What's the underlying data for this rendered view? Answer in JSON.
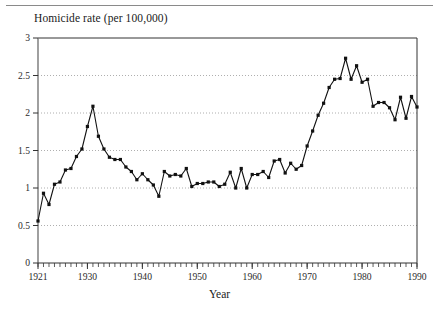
{
  "figure": {
    "title": "Homicide rate (per 100,000)",
    "x_axis_label": "Year",
    "has_top_rule": true
  },
  "chart_data": {
    "type": "line",
    "title": "Homicide rate (per 100,000)",
    "subtitle": "",
    "xlabel": "Year",
    "ylabel": "Homicide rate (per 100,000)",
    "xlim": [
      1921,
      1990
    ],
    "ylim": [
      0,
      3
    ],
    "grid": true,
    "grid_axis": "y",
    "grid_style": "dotted",
    "legend": null,
    "legend_position": "none",
    "marker": "square",
    "line_color": "#111111",
    "marker_color": "#111111",
    "x_ticks_labeled": [
      1921,
      1930,
      1940,
      1950,
      1960,
      1970,
      1980,
      1990
    ],
    "x_tick_interval_minor": 1,
    "y_ticks": [
      0,
      0.5,
      1,
      1.5,
      2,
      2.5,
      3
    ],
    "y_tick_labels": [
      "0",
      "0.5",
      "1",
      "1.5",
      "2",
      "2.5",
      "3"
    ],
    "x": [
      1921,
      1922,
      1923,
      1924,
      1925,
      1926,
      1927,
      1928,
      1929,
      1930,
      1931,
      1932,
      1933,
      1934,
      1935,
      1936,
      1937,
      1938,
      1939,
      1940,
      1941,
      1942,
      1943,
      1944,
      1945,
      1946,
      1947,
      1948,
      1949,
      1950,
      1951,
      1952,
      1953,
      1954,
      1955,
      1956,
      1957,
      1958,
      1959,
      1960,
      1961,
      1962,
      1963,
      1964,
      1965,
      1966,
      1967,
      1968,
      1969,
      1970,
      1971,
      1972,
      1973,
      1974,
      1975,
      1976,
      1977,
      1978,
      1979,
      1980,
      1981,
      1982,
      1983,
      1984,
      1985,
      1986,
      1987,
      1988,
      1989,
      1990
    ],
    "values": [
      0.56,
      0.93,
      0.78,
      1.05,
      1.08,
      1.24,
      1.26,
      1.42,
      1.52,
      1.82,
      2.09,
      1.69,
      1.52,
      1.41,
      1.38,
      1.38,
      1.28,
      1.22,
      1.11,
      1.19,
      1.11,
      1.04,
      0.89,
      1.22,
      1.16,
      1.18,
      1.16,
      1.26,
      1.02,
      1.06,
      1.06,
      1.08,
      1.08,
      1.02,
      1.05,
      1.21,
      1.0,
      1.26,
      1.0,
      1.18,
      1.18,
      1.22,
      1.14,
      1.36,
      1.38,
      1.2,
      1.33,
      1.25,
      1.3,
      1.56,
      1.76,
      1.97,
      2.13,
      2.34,
      2.45,
      2.46,
      2.73,
      2.45,
      2.63,
      2.41,
      2.45,
      2.09,
      2.14,
      2.14,
      2.07,
      1.91,
      2.21,
      1.93,
      2.22,
      2.08
    ],
    "series": [
      {
        "name": "Homicide rate",
        "values": [
          0.56,
          0.93,
          0.78,
          1.05,
          1.08,
          1.24,
          1.26,
          1.42,
          1.52,
          1.82,
          2.09,
          1.69,
          1.52,
          1.41,
          1.38,
          1.38,
          1.28,
          1.22,
          1.11,
          1.19,
          1.11,
          1.04,
          0.89,
          1.22,
          1.16,
          1.18,
          1.16,
          1.26,
          1.02,
          1.06,
          1.06,
          1.08,
          1.08,
          1.02,
          1.05,
          1.21,
          1.0,
          1.26,
          1.0,
          1.18,
          1.18,
          1.22,
          1.14,
          1.36,
          1.38,
          1.2,
          1.33,
          1.25,
          1.3,
          1.56,
          1.76,
          1.97,
          2.13,
          2.34,
          2.45,
          2.46,
          2.73,
          2.45,
          2.63,
          2.41,
          2.45,
          2.09,
          2.14,
          2.14,
          2.07,
          1.91,
          2.21,
          1.93,
          2.22,
          2.08
        ]
      }
    ],
    "annotations": []
  }
}
